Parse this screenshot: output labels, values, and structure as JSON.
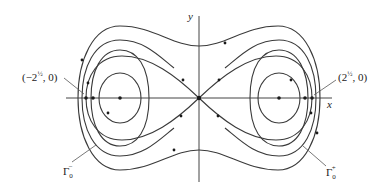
{
  "figure": {
    "axes": {
      "x_label": "x",
      "y_label": "y"
    },
    "labels": {
      "left_point": "(−2",
      "left_point_exp": "½",
      "left_point_tail": ", 0)",
      "right_point": "(2",
      "right_point_exp": "½",
      "right_point_tail": ", 0)",
      "gamma_minus": "Γ",
      "gamma_minus_sub": "0",
      "gamma_minus_sup": "−",
      "gamma_plus": "Γ",
      "gamma_plus_sub": "0",
      "gamma_plus_sup": "+"
    }
  }
}
